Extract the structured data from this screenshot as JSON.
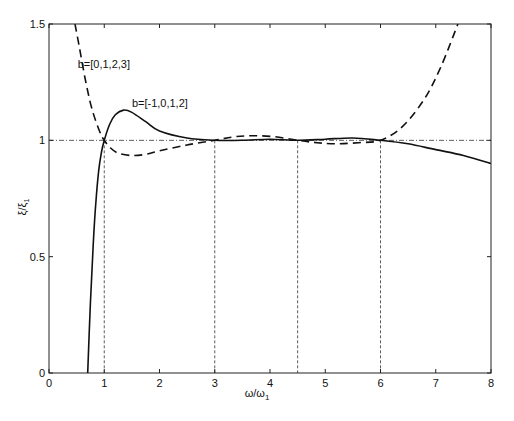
{
  "chart_data": {
    "type": "line",
    "title": "",
    "xlabel": "ω/ω1",
    "xlabel_main": "ω/ω",
    "xlabel_sub": "1",
    "ylabel": "ξ/ξ1",
    "ylabel_main": "ξ/ξ",
    "ylabel_sub": "1",
    "xlim": [
      0,
      8
    ],
    "ylim": [
      0,
      1.5
    ],
    "xticks": [
      0,
      1,
      2,
      3,
      4,
      5,
      6,
      7,
      8
    ],
    "xtick_labels": [
      "0",
      "1",
      "2",
      "3",
      "4",
      "5",
      "6",
      "7",
      "8"
    ],
    "yticks": [
      0,
      0.5,
      1,
      1.5
    ],
    "ytick_labels": [
      "0",
      "0.5",
      "1",
      "1.5"
    ],
    "grid": false,
    "legend": null,
    "reference_line": {
      "y": 1,
      "style": "dash-dot"
    },
    "vertical_markers": [
      1,
      3,
      4.5,
      6
    ],
    "series": [
      {
        "name": "b=[-1,0,1,2]",
        "style": "solid",
        "x": [
          0.7,
          0.75,
          0.8,
          0.85,
          0.9,
          0.95,
          1.0,
          1.1,
          1.2,
          1.35,
          1.5,
          1.75,
          2.0,
          2.5,
          3.0,
          3.5,
          4.0,
          4.5,
          5.0,
          5.5,
          6.0,
          6.5,
          7.0,
          7.5,
          8.0
        ],
        "values": [
          0.0,
          0.3,
          0.55,
          0.74,
          0.87,
          0.95,
          1.0,
          1.07,
          1.11,
          1.13,
          1.12,
          1.08,
          1.04,
          1.01,
          1.0,
          1.0,
          1.005,
          1.0,
          1.005,
          1.01,
          1.0,
          0.985,
          0.96,
          0.935,
          0.9
        ]
      },
      {
        "name": "b=[0,1,2,3]",
        "style": "dashed",
        "x": [
          0.47,
          0.55,
          0.65,
          0.75,
          0.85,
          0.95,
          1.0,
          1.1,
          1.25,
          1.5,
          1.75,
          2.0,
          2.5,
          3.0,
          3.35,
          3.7,
          4.1,
          4.5,
          4.85,
          5.2,
          5.6,
          6.0,
          6.4,
          6.8,
          7.1,
          7.4
        ],
        "values": [
          1.5,
          1.4,
          1.27,
          1.16,
          1.08,
          1.02,
          1.0,
          0.97,
          0.945,
          0.935,
          0.94,
          0.955,
          0.98,
          1.0,
          1.015,
          1.02,
          1.015,
          1.0,
          0.99,
          0.985,
          0.99,
          1.0,
          1.06,
          1.18,
          1.32,
          1.5
        ]
      }
    ],
    "annotations": [
      {
        "text": "b=[0,1,2,3]",
        "x": 0.52,
        "y": 1.31
      },
      {
        "text": "b=[-1,0,1,2]",
        "x": 1.5,
        "y": 1.145
      }
    ]
  }
}
